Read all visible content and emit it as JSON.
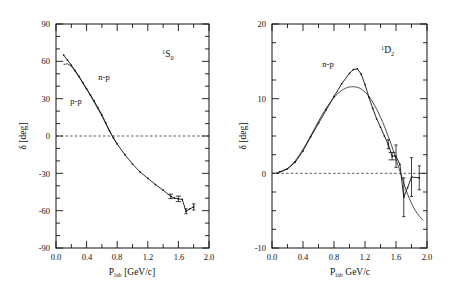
{
  "figure": {
    "background": "#ffffff",
    "ink": "#111111",
    "width": 460,
    "height": 294
  },
  "chart_data": [
    {
      "id": "left-panel",
      "type": "line",
      "title": "1S0",
      "title_parts": {
        "sup": "1",
        "letter": "S",
        "sub": "0"
      },
      "xlabel": "P_lab [GeV/c]",
      "xlabel_parts": {
        "base": "P",
        "sub": "lab",
        "unit": "[GeV/c]"
      },
      "ylabel": "δ [deg]",
      "xlim": [
        0.0,
        2.0
      ],
      "ylim": [
        -90,
        90
      ],
      "xticks": [
        0.0,
        0.4,
        0.8,
        1.2,
        1.6,
        2.0
      ],
      "xticklabels": [
        "0.0",
        "0.4",
        "0.8",
        "1.2",
        "1.6",
        "2.0"
      ],
      "yticks": [
        -90,
        -60,
        -30,
        0,
        30,
        60,
        90
      ],
      "yticklabels": [
        "-90",
        "-60",
        "-30",
        "0",
        "30",
        "60",
        "90"
      ],
      "xminor_step": 0.1,
      "yminor_step": 10,
      "grid": false,
      "zero_reference_line": 0,
      "legend_position": "inside-upper-left",
      "annotations": [
        {
          "text": "n-p",
          "x": 0.62,
          "y": 45
        },
        {
          "text": "p-p",
          "x": 0.3,
          "y": 26
        }
      ],
      "series": [
        {
          "name": "n-p",
          "style": "line-with-points",
          "x": [
            0.1,
            0.15,
            0.2,
            0.25,
            0.3,
            0.35,
            0.4,
            0.45,
            0.5,
            0.55,
            0.6,
            0.65,
            0.7,
            0.75,
            0.8,
            0.9,
            1.0,
            1.1,
            1.2,
            1.3,
            1.4,
            1.5,
            1.55,
            1.6,
            1.65,
            1.7,
            1.75,
            1.8
          ],
          "y": [
            65.0,
            61.0,
            57.0,
            52.5,
            48.0,
            43.0,
            38.0,
            33.0,
            28.0,
            22.5,
            17.0,
            10.5,
            4.0,
            -1.5,
            -6.5,
            -15.0,
            -22.5,
            -29.0,
            -34.0,
            -39.0,
            -43.5,
            -48.5,
            -50.0,
            -50.5,
            -51.0,
            -60.5,
            -58.5,
            -57.0
          ]
        },
        {
          "name": "p-p",
          "style": "line",
          "x": [
            0.1,
            0.15,
            0.2,
            0.25,
            0.3,
            0.35,
            0.4,
            0.45,
            0.5,
            0.55,
            0.6,
            0.65,
            0.7,
            0.75,
            0.8
          ],
          "y": [
            57.5,
            58.0,
            56.0,
            52.0,
            47.5,
            42.5,
            37.5,
            32.5,
            27.0,
            21.5,
            16.0,
            10.0,
            4.0,
            -1.5,
            -6.5
          ]
        }
      ],
      "errorbars": [
        {
          "x": 1.5,
          "y": -48.5,
          "yerr": 1.8,
          "xerr": 0.03
        },
        {
          "x": 1.6,
          "y": -50.5,
          "yerr": 2.2,
          "xerr": 0.035
        },
        {
          "x": 1.7,
          "y": -60.5,
          "yerr": 2.0,
          "xerr": 0.02
        },
        {
          "x": 1.8,
          "y": -57.0,
          "yerr": 2.5,
          "xerr": 0.02
        }
      ]
    },
    {
      "id": "right-panel",
      "type": "line",
      "title": "1D2",
      "title_parts": {
        "sup": "1",
        "letter": "D",
        "sub": "2"
      },
      "xlabel": "P_lab GeV/c",
      "xlabel_parts": {
        "base": "P",
        "sub": "lab",
        "unit": "GeV/c"
      },
      "ylabel": "δ [deg]",
      "xlim": [
        0.0,
        2.0
      ],
      "ylim": [
        -10,
        20
      ],
      "xticks": [
        0.0,
        0.4,
        0.8,
        1.2,
        1.6,
        2.0
      ],
      "xticklabels": [
        "0.0",
        "0.4",
        "0.8",
        "1.2",
        "1.6",
        "2.0"
      ],
      "yticks": [
        -10,
        0,
        10,
        20
      ],
      "yticklabels": [
        "-10",
        "0",
        "10",
        "20"
      ],
      "xminor_step": 0.1,
      "yminor_step": 2.5,
      "grid": false,
      "zero_reference_line": 0,
      "legend_position": "inside-upper-left",
      "annotations": [
        {
          "text": "n-p",
          "x": 0.72,
          "y": 14.2
        }
      ],
      "series": [
        {
          "name": "n-p data",
          "style": "line-with-points",
          "x": [
            0.1,
            0.2,
            0.3,
            0.4,
            0.5,
            0.6,
            0.7,
            0.8,
            0.9,
            1.0,
            1.05,
            1.1,
            1.15,
            1.2,
            1.25,
            1.3,
            1.35,
            1.4,
            1.45,
            1.5,
            1.55,
            1.6,
            1.65,
            1.7,
            1.75,
            1.8,
            1.9
          ],
          "y": [
            0.2,
            0.6,
            1.5,
            3.0,
            4.9,
            6.7,
            8.5,
            10.3,
            12.0,
            13.4,
            13.9,
            14.0,
            13.3,
            11.9,
            10.2,
            8.7,
            7.3,
            6.2,
            5.0,
            3.9,
            2.3,
            2.3,
            1.2,
            -3.2,
            -1.9,
            -0.5,
            -0.6
          ]
        },
        {
          "name": "theory",
          "style": "smooth-line",
          "x": [
            0.05,
            0.15,
            0.25,
            0.35,
            0.45,
            0.55,
            0.65,
            0.75,
            0.85,
            0.95,
            1.05,
            1.15,
            1.25,
            1.35,
            1.45,
            1.55,
            1.65,
            1.75,
            1.85,
            1.95
          ],
          "y": [
            0.05,
            0.35,
            1.1,
            2.4,
            4.1,
            6.0,
            7.9,
            9.5,
            10.7,
            11.4,
            11.6,
            11.3,
            10.3,
            8.6,
            6.3,
            3.5,
            0.3,
            -2.8,
            -5.0,
            -6.3
          ]
        }
      ],
      "errorbars": [
        {
          "x": 1.5,
          "y": 3.9,
          "yerr": 0.6,
          "xerr": 0.02
        },
        {
          "x": 1.55,
          "y": 2.3,
          "yerr": 0.5,
          "xerr": 0.045
        },
        {
          "x": 1.6,
          "y": 2.3,
          "yerr": 1.5,
          "xerr": 0.02
        },
        {
          "x": 1.7,
          "y": -3.2,
          "yerr": 2.6,
          "xerr": 0.02
        },
        {
          "x": 1.8,
          "y": -0.5,
          "yerr": 2.6,
          "xerr": 0.02
        },
        {
          "x": 1.9,
          "y": -0.6,
          "yerr": 1.6,
          "xerr": 0.02
        }
      ]
    }
  ]
}
